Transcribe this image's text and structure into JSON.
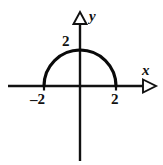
{
  "figure": {
    "background_color": "#ffffff",
    "ink_color": "#111111"
  },
  "axes": {
    "x_axis_label": "x",
    "y_axis_label": "y",
    "x_arrow_icon": "arrow-right-hollow-triangle-icon",
    "y_arrow_icon": "arrow-up-hollow-triangle-icon",
    "origin_label": ""
  },
  "labels": {
    "x_left": "–2",
    "x_right": "2",
    "y_top": "2"
  },
  "chart_data": {
    "type": "line",
    "xlabel": "x",
    "ylabel": "y",
    "xlim": [
      -2.9,
      3.1
    ],
    "ylim": [
      -2.4,
      3.3
    ],
    "grid": false,
    "legend": null,
    "x_ticks": [
      -2,
      2
    ],
    "x_tick_labels": [
      "–2",
      "2"
    ],
    "y_ticks": [
      2
    ],
    "y_tick_labels": [
      "2"
    ],
    "series": [
      {
        "name": "y = sqrt(4 - x^2)",
        "equation": "x^2 + y^2 = 4, y >= 0",
        "radius": 2,
        "center": [
          0,
          0
        ],
        "x": [
          -2.0,
          -1.8,
          -1.6,
          -1.4,
          -1.2,
          -1.0,
          -0.8,
          -0.6,
          -0.4,
          -0.2,
          0.0,
          0.2,
          0.4,
          0.6,
          0.8,
          1.0,
          1.2,
          1.4,
          1.6,
          1.8,
          2.0
        ],
        "values": [
          0.0,
          0.87,
          1.2,
          1.43,
          1.6,
          1.73,
          1.83,
          1.91,
          1.96,
          1.99,
          2.0,
          1.99,
          1.96,
          1.91,
          1.83,
          1.73,
          1.6,
          1.43,
          1.2,
          0.87,
          0.0
        ]
      }
    ],
    "annotations": [
      {
        "text": "2",
        "x": -0.35,
        "y": 2.25,
        "note": "y-intercept label, left of y-axis"
      },
      {
        "text": "–2",
        "x": -2.0,
        "y": -0.45,
        "note": "left x-intercept label, below axis"
      },
      {
        "text": "2",
        "x": 2.0,
        "y": -0.45,
        "note": "right x-intercept label, below axis"
      }
    ]
  }
}
